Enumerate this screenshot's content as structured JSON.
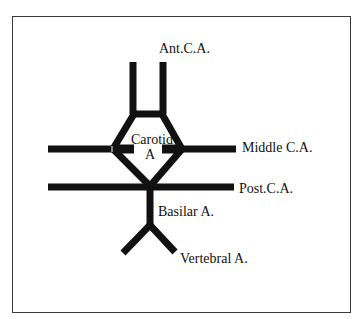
{
  "diagram": {
    "type": "anatomical-schematic",
    "stroke_color": "#111111",
    "frame_color": "#3a3a3a",
    "background": "#ffffff",
    "labels": {
      "anterior": "Ant.C.A.",
      "carotid_line1": "Carotid",
      "carotid_line2": "A",
      "middle": "Middle C.A.",
      "posterior": "Post.C.A.",
      "basilar": "Basilar A.",
      "vertebral": "Vertebral A."
    },
    "vessels": [
      {
        "name": "Anterior cerebral artery (left)",
        "label_key": "anterior"
      },
      {
        "name": "Anterior cerebral artery (right)",
        "label_key": "anterior"
      },
      {
        "name": "Anterior communicating segment"
      },
      {
        "name": "Internal carotid artery ring",
        "label_key": "carotid"
      },
      {
        "name": "Middle cerebral artery",
        "label_key": "middle"
      },
      {
        "name": "Posterior cerebral artery",
        "label_key": "posterior"
      },
      {
        "name": "Basilar artery",
        "label_key": "basilar"
      },
      {
        "name": "Vertebral arteries",
        "label_key": "vertebral"
      }
    ]
  }
}
